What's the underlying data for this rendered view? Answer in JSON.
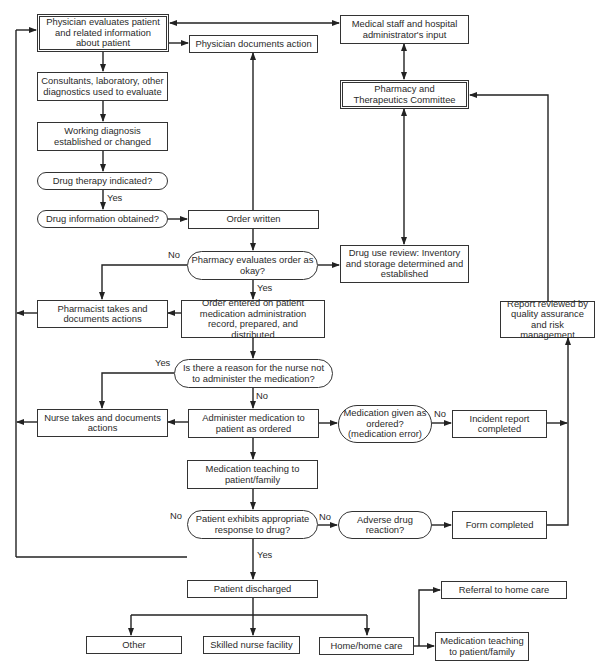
{
  "nodes": {
    "physician_evaluates": "Physician evaluates patient and related information about patient",
    "physician_documents": "Physician documents action",
    "medical_staff_input": "Medical staff and hospital administrator's input",
    "pt_committee": "Pharmacy and Therapeutics Committee",
    "consultants": "Consultants, laboratory, other diagnostics used to evaluate",
    "working_diagnosis": "Working diagnosis established or changed",
    "drug_therapy_indicated": "Drug therapy indicated?",
    "drug_info_obtained": "Drug information obtained?",
    "order_written": "Order written",
    "pharmacy_evaluates": "Pharmacy evaluates order as okay?",
    "drug_use_review": "Drug use review: Inventory and storage determined and established",
    "pharmacist_takes": "Pharmacist takes and documents actions",
    "order_entered": "Order entered on patient medication administration record, prepared, and distributed",
    "report_reviewed": "Report reviewed by quality assurance and risk management",
    "reason_not_administer": "Is there a reason for the nurse not to administer the medication?",
    "nurse_takes": "Nurse takes and documents actions",
    "administer_medication": "Administer medication to patient as ordered",
    "medication_given": "Medication given as ordered? (medication error)",
    "incident_report": "Incident report completed",
    "medication_teaching": "Medication teaching to patient/family",
    "appropriate_response": "Patient exhibits appropriate response to drug?",
    "adverse_reaction": "Adverse drug reaction?",
    "form_completed": "Form completed",
    "patient_discharged": "Patient discharged",
    "other": "Other",
    "skilled_nurse_facility": "Skilled nurse facility",
    "home_care": "Home/home care",
    "referral_home_care": "Referral to home care",
    "medication_teaching_home": "Medication teaching to patient/family"
  },
  "labels": {
    "yes_drug_therapy": "Yes",
    "no_pharmacy": "No",
    "yes_pharmacy": "Yes",
    "yes_reason": "Yes",
    "no_reason": "No",
    "no_medication_given": "No",
    "no_response": "No",
    "no_response_right": "No",
    "yes_response": "Yes"
  }
}
